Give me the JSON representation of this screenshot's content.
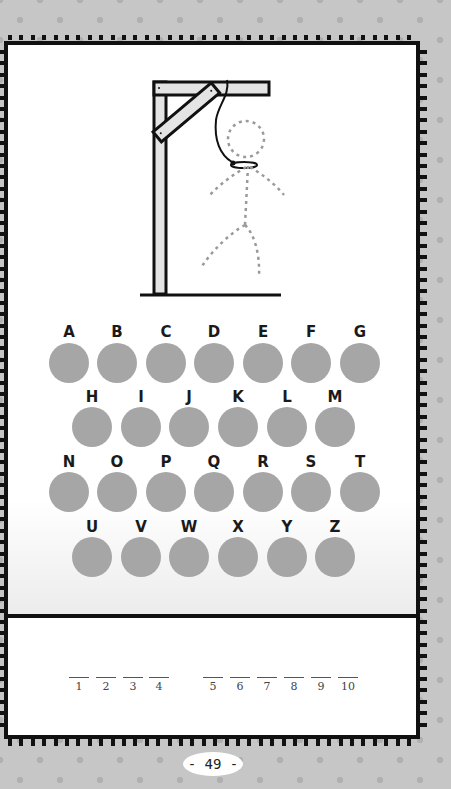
{
  "game": {
    "type": "hangman",
    "letters_row1": [
      "A",
      "B",
      "C",
      "D",
      "E",
      "F",
      "G"
    ],
    "letters_row2": [
      "H",
      "I",
      "J",
      "K",
      "L",
      "M"
    ],
    "letters_row3": [
      "N",
      "O",
      "P",
      "Q",
      "R",
      "S",
      "T"
    ],
    "letters_row4": [
      "U",
      "V",
      "W",
      "X",
      "Y",
      "Z"
    ],
    "word_groups": [
      [
        "1",
        "2",
        "3",
        "4"
      ],
      [
        "5",
        "6",
        "7",
        "8",
        "9",
        "10"
      ]
    ],
    "blank_labels": [
      "1",
      "2",
      "3",
      "4",
      "5",
      "6",
      "7",
      "8",
      "9",
      "10"
    ]
  },
  "colors": {
    "background": "#c6c6c6",
    "dots": "#b0b0b0",
    "frame": "#111111",
    "letter_circle": "#a6a6a6",
    "gallows_fill": "#e4e4e4",
    "figure_dashed": "#9a9a9a"
  },
  "footer": {
    "page_number": "- 49 -"
  }
}
